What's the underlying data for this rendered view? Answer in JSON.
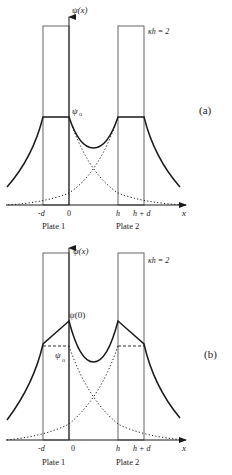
{
  "colors": {
    "ink": "#1a1a1a",
    "plate": "#555555",
    "background": "#ffffff"
  },
  "panels": [
    {
      "id": "a",
      "panel_label": "(a)",
      "y_axis_label": "ψ(x)",
      "x_axis_label": "x",
      "parameter_label": "κh = 2",
      "potential_labels": [
        "ψ",
        "o"
      ],
      "tick_labels": [
        "-d",
        "0",
        "h",
        "h + d"
      ],
      "plate_labels": [
        "Plate 1",
        "Plate 2"
      ],
      "description": "Constant potential inside plates; overlapping exponential decays (dotted) combine into total potential (solid)"
    },
    {
      "id": "b",
      "panel_label": "(b)",
      "y_axis_label": "ψ(x)",
      "x_axis_label": "x",
      "parameter_label": "κh = 2",
      "peak_label": "ψ(0)",
      "potential_labels": [
        "ψ",
        "o"
      ],
      "tick_labels": [
        "-d",
        "0",
        "h",
        "h + d"
      ],
      "plate_labels": [
        "Plate 1",
        "Plate 2"
      ],
      "description": "Potential rises linearly inside plates to peak ψ(0) at inner surfaces; dashed line marks ψo"
    }
  ]
}
